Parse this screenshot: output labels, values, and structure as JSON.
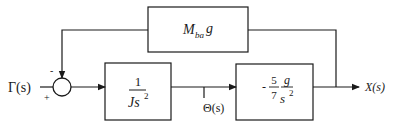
{
  "diagram": {
    "type": "block-diagram",
    "input": {
      "label": "Γ(s)"
    },
    "output": {
      "label": "X(s)"
    },
    "summing_junction": {
      "minus_sign": "-",
      "plus_sign": "+"
    },
    "blocks": [
      {
        "id": "feedback",
        "main": "M",
        "sub": "ba",
        "tail": "g"
      },
      {
        "id": "plant1",
        "numerator": "1",
        "den_main": "Js",
        "den_exp": "2"
      },
      {
        "id": "plant2",
        "sign": "-",
        "coef_num": "5",
        "coef_den": "7",
        "frac_num": "g",
        "frac_den_main": "s",
        "frac_den_exp": "2"
      }
    ],
    "intermediate_signal": {
      "label": "Θ(s)"
    },
    "colors": {
      "line": "#1a1a1a",
      "background": "#ffffff"
    }
  }
}
